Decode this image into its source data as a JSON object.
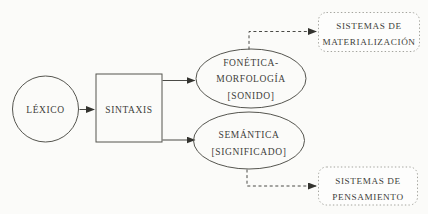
{
  "diagram": {
    "background_color": "#fbfbf9",
    "line_color": "#4a4a46",
    "dotted_border_color": "#a4a49e",
    "text_color": "#3e3e3a",
    "nodes": {
      "lexico": {
        "shape": "circle",
        "label": "LÉXICO"
      },
      "sintaxis": {
        "shape": "rect",
        "label": "SINTAXIS"
      },
      "fonetica": {
        "shape": "ellipse",
        "lines": [
          "FONÉTICA-",
          "MORFOLOGÍA",
          "[SONIDO]"
        ]
      },
      "semantica": {
        "shape": "ellipse",
        "lines": [
          "SEMÁNTICA",
          "[SIGNIFICADO]"
        ]
      },
      "materializacion": {
        "shape": "rounded-rect-dotted",
        "lines": [
          "SISTEMAS DE",
          "MATERIALIZACIÓN"
        ]
      },
      "pensamiento": {
        "shape": "rounded-rect-dotted",
        "lines": [
          "SISTEMAS DE",
          "PENSAMIENTO"
        ]
      }
    },
    "edges": [
      {
        "from": "lexico",
        "to": "sintaxis",
        "style": "solid-arrow"
      },
      {
        "from": "sintaxis",
        "to": "fonetica",
        "style": "solid-arrow"
      },
      {
        "from": "sintaxis",
        "to": "semantica",
        "style": "solid-arrow"
      },
      {
        "from": "fonetica",
        "to": "materializacion",
        "style": "dashed-elbow-arrow"
      },
      {
        "from": "semantica",
        "to": "pensamiento",
        "style": "dashed-elbow-arrow"
      }
    ]
  }
}
